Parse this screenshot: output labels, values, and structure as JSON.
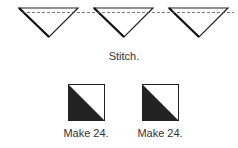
{
  "top_step": {
    "caption": "Stitch.",
    "triangle_count": 3,
    "stitch_line": "dashed"
  },
  "bottom_step": {
    "units": [
      {
        "caption": "Make 24."
      },
      {
        "caption": "Make 24."
      }
    ]
  },
  "colors": {
    "stroke": "#1a1a1a",
    "fill_dark": "#222222",
    "fill_light": "#ffffff"
  }
}
